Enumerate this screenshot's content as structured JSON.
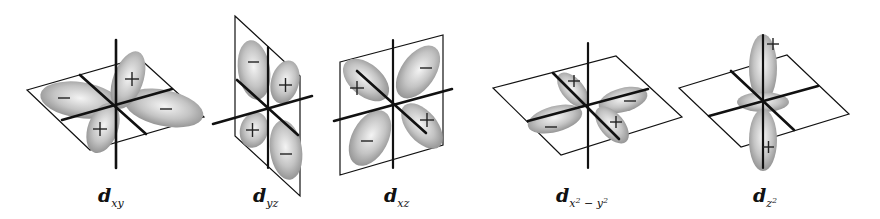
{
  "figure": {
    "colors": {
      "lobe_light": "#f2f2f2",
      "lobe_dark": "#8c8c8c",
      "line": "#111111",
      "background": "#ffffff"
    },
    "orbitals": [
      {
        "id": "dxy",
        "label_base": "d",
        "label_sub": "xy",
        "plane": "horizontal (xy-plane)",
        "lobe_signs": [
          "+",
          "−",
          "+",
          "−"
        ]
      },
      {
        "id": "dyz",
        "label_base": "d",
        "label_sub": "yz",
        "plane": "vertical (yz-plane)",
        "lobe_signs": [
          "−",
          "+",
          "+",
          "−"
        ]
      },
      {
        "id": "dxz",
        "label_base": "d",
        "label_sub": "xz",
        "plane": "vertical (xz-plane)",
        "lobe_signs": [
          "+",
          "−",
          "−",
          "+"
        ]
      },
      {
        "id": "dx2-y2",
        "label_base": "d",
        "label_sub_pre": "x",
        "label_sub_sup1": "2",
        "label_sub_mid": " − y",
        "label_sub_sup2": "2",
        "plane": "horizontal (xy-plane), lobes on axes",
        "lobe_signs": [
          "+",
          "−",
          "+",
          "−"
        ]
      },
      {
        "id": "dz2",
        "label_base": "d",
        "label_sub_pre": "z",
        "label_sub_sup1": "2",
        "plane": "horizontal plane with lobes along z-axis and torus",
        "lobe_signs": [
          "+",
          "+"
        ]
      }
    ]
  }
}
